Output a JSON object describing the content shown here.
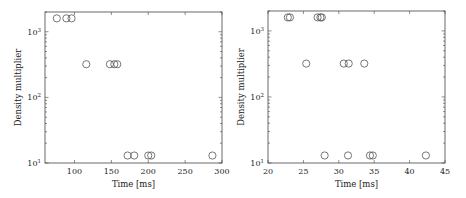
{
  "chart_data": [
    {
      "type": "scatter",
      "title": "",
      "xlabel": "Time [ms]",
      "ylabel": "Density multiplier",
      "xlim": [
        60,
        300
      ],
      "ylim": [
        10,
        2000
      ],
      "yscale": "log",
      "xticks": [
        100,
        150,
        200,
        250,
        300
      ],
      "yticks": [
        "10^1",
        "10^2",
        "10^3"
      ],
      "grid": false,
      "legend": null,
      "points": [
        {
          "x": 76,
          "y": 1600
        },
        {
          "x": 89,
          "y": 1600
        },
        {
          "x": 96,
          "y": 1600
        },
        {
          "x": 116,
          "y": 320
        },
        {
          "x": 148,
          "y": 320
        },
        {
          "x": 154,
          "y": 320
        },
        {
          "x": 158,
          "y": 320
        },
        {
          "x": 172,
          "y": 13
        },
        {
          "x": 181,
          "y": 13
        },
        {
          "x": 200,
          "y": 13
        },
        {
          "x": 204,
          "y": 13
        },
        {
          "x": 287,
          "y": 13
        }
      ]
    },
    {
      "type": "scatter",
      "title": "",
      "xlabel": "Time [ms]",
      "ylabel": "Density multiplier",
      "xlim": [
        20,
        45
      ],
      "ylim": [
        10,
        2000
      ],
      "yscale": "log",
      "xticks": [
        20,
        25,
        30,
        35,
        40,
        45
      ],
      "yticks": [
        "10^1",
        "10^2",
        "10^3"
      ],
      "grid": false,
      "legend": null,
      "points": [
        {
          "x": 22.8,
          "y": 1600
        },
        {
          "x": 23.1,
          "y": 1600
        },
        {
          "x": 27.0,
          "y": 1600
        },
        {
          "x": 27.4,
          "y": 1600
        },
        {
          "x": 27.6,
          "y": 1600
        },
        {
          "x": 25.4,
          "y": 320
        },
        {
          "x": 30.7,
          "y": 320
        },
        {
          "x": 31.4,
          "y": 320
        },
        {
          "x": 33.6,
          "y": 320
        },
        {
          "x": 28.0,
          "y": 13
        },
        {
          "x": 31.3,
          "y": 13
        },
        {
          "x": 34.4,
          "y": 13
        },
        {
          "x": 34.8,
          "y": 13
        },
        {
          "x": 42.3,
          "y": 13
        }
      ]
    }
  ],
  "labels": {
    "left": {
      "xlabel": "Time [ms]",
      "ylabel": "Density multiplier",
      "xticks": [
        "100",
        "150",
        "200",
        "250",
        "300"
      ]
    },
    "right": {
      "xlabel": "Time [ms]",
      "ylabel": "Density multiplier",
      "xticks": [
        "20",
        "25",
        "30",
        "35",
        "40",
        "45"
      ]
    },
    "ytick_base": "10",
    "ytick_exps": [
      "1",
      "2",
      "3"
    ]
  }
}
